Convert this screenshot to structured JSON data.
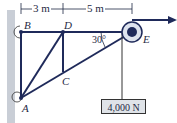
{
  "diagram": {
    "nodes": {
      "A": "A",
      "B": "B",
      "C": "C",
      "D": "D",
      "E": "E"
    },
    "dimensions": {
      "BD": "3 m",
      "DE": "5 m"
    },
    "angle": "30°",
    "load": "4,000 N",
    "colors": {
      "member": "#1f2a5a",
      "wall": "#c9ced6",
      "load_box": "#dfe3e8"
    }
  }
}
